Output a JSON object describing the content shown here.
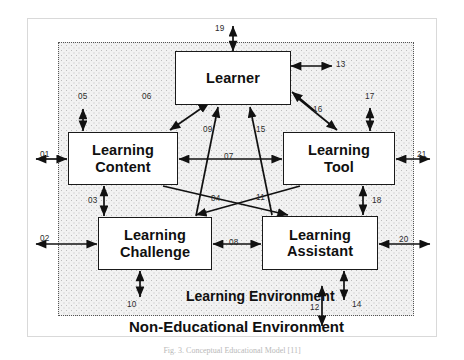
{
  "figure": {
    "caption": "Fig. 3. Conceptual Educational Model [11]",
    "frame_color": "#d9d9d9"
  },
  "diagram": {
    "type": "block-diagram",
    "regions": [
      {
        "id": "learning-environment",
        "label": "Learning Environment",
        "border": "dotted",
        "fill": "#f2f2f2"
      },
      {
        "id": "non-educational-environment",
        "label": "Non-Educational Environment",
        "border": "solid",
        "fill": "#ffffff"
      }
    ],
    "nodes": [
      {
        "id": "learner",
        "label": "Learner"
      },
      {
        "id": "content",
        "label": "Learning\nContent",
        "line1": "Learning",
        "line2": "Content"
      },
      {
        "id": "tool",
        "label": "Learning\nTool",
        "line1": "Learning",
        "line2": "Tool"
      },
      {
        "id": "challenge",
        "label": "Learning\nChallenge",
        "line1": "Learning",
        "line2": "Challenge"
      },
      {
        "id": "assistant",
        "label": "Learning\nAssistant",
        "line1": "Learning",
        "line2": "Assistant"
      }
    ],
    "edges": [
      {
        "num": "01",
        "from": "non-educational-environment",
        "to": "content",
        "arrows": "both",
        "orientation": "horizontal"
      },
      {
        "num": "02",
        "from": "non-educational-environment",
        "to": "challenge",
        "arrows": "both",
        "orientation": "horizontal"
      },
      {
        "num": "03",
        "from": "content",
        "to": "challenge",
        "arrows": "both",
        "orientation": "vertical"
      },
      {
        "num": "04",
        "from": "content",
        "to": "assistant",
        "arrows": "single",
        "orientation": "diagonal"
      },
      {
        "num": "05",
        "from": "learning-environment",
        "to": "content",
        "arrows": "both",
        "orientation": "vertical"
      },
      {
        "num": "06",
        "from": "content",
        "to": "learner",
        "arrows": "both",
        "orientation": "diagonal"
      },
      {
        "num": "07",
        "from": "content",
        "to": "tool",
        "arrows": "both",
        "orientation": "horizontal"
      },
      {
        "num": "08",
        "from": "challenge",
        "to": "assistant",
        "arrows": "both",
        "orientation": "horizontal"
      },
      {
        "num": "09",
        "from": "challenge",
        "to": "learner",
        "arrows": "single",
        "orientation": "diagonal"
      },
      {
        "num": "10",
        "from": "challenge",
        "to": "learning-environment",
        "arrows": "both",
        "orientation": "vertical"
      },
      {
        "num": "11",
        "from": "tool",
        "to": "challenge",
        "arrows": "single",
        "orientation": "diagonal"
      },
      {
        "num": "12",
        "from": "learning-environment",
        "to": "non-educational-environment",
        "arrows": "both",
        "orientation": "vertical"
      },
      {
        "num": "13",
        "from": "learner",
        "to": "learning-environment",
        "arrows": "both",
        "orientation": "horizontal"
      },
      {
        "num": "14",
        "from": "assistant",
        "to": "learning-environment",
        "arrows": "both",
        "orientation": "vertical"
      },
      {
        "num": "15",
        "from": "assistant",
        "to": "learner",
        "arrows": "single",
        "orientation": "diagonal"
      },
      {
        "num": "16",
        "from": "learner",
        "to": "tool",
        "arrows": "single",
        "orientation": "diagonal"
      },
      {
        "num": "17",
        "from": "learning-environment",
        "to": "tool",
        "arrows": "both",
        "orientation": "vertical"
      },
      {
        "num": "18",
        "from": "tool",
        "to": "assistant",
        "arrows": "both",
        "orientation": "vertical"
      },
      {
        "num": "19",
        "from": "learner",
        "to": "outside",
        "arrows": "both",
        "orientation": "vertical"
      },
      {
        "num": "20",
        "from": "assistant",
        "to": "outside",
        "arrows": "both",
        "orientation": "horizontal"
      },
      {
        "num": "21",
        "from": "tool",
        "to": "outside",
        "arrows": "both",
        "orientation": "horizontal"
      }
    ],
    "edge_numbers": [
      "01",
      "02",
      "03",
      "04",
      "05",
      "06",
      "07",
      "08",
      "09",
      "10",
      "11",
      "12",
      "13",
      "14",
      "15",
      "16",
      "17",
      "18",
      "19",
      "20",
      "21"
    ]
  },
  "colors": {
    "node_border": "#1a1a1a",
    "arrow": "#111111",
    "region_fill": "#f2f2f2",
    "text": "#101010"
  }
}
